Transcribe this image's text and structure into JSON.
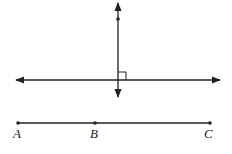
{
  "diagram": {
    "type": "geometry",
    "colors": {
      "stroke": "#222222",
      "background": "#ffffff"
    },
    "perpendicular_lines": {
      "vertical": {
        "x": 118,
        "y1": 3,
        "y2": 97,
        "point_y": 19
      },
      "horizontal": {
        "y": 80,
        "x1": 16,
        "x2": 220
      },
      "right_angle_marker": true
    },
    "segment": {
      "y": 123,
      "points": [
        {
          "label": "A",
          "x": 18
        },
        {
          "label": "B",
          "x": 95
        },
        {
          "label": "C",
          "x": 210
        }
      ]
    }
  }
}
